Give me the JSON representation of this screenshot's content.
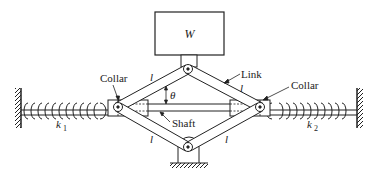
{
  "diagram": {
    "type": "mechanical-system",
    "labels": {
      "weight": "W",
      "collar_left": "Collar",
      "collar_right": "Collar",
      "link": "Link",
      "shaft": "Shaft",
      "angle": "θ",
      "link_length_top_left": "l",
      "link_length_top_right": "l",
      "link_length_bottom_left": "l",
      "link_length_bottom_right": "l",
      "spring_left": "k",
      "spring_left_sub": "1",
      "spring_right": "k",
      "spring_right_sub": "2"
    },
    "colors": {
      "stroke": "#222222",
      "background": "#ffffff"
    }
  }
}
